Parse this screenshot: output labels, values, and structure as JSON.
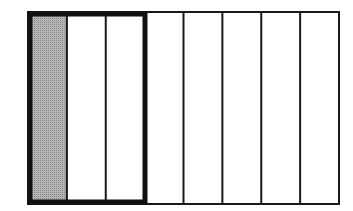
{
  "diagram": {
    "title": "",
    "total_parts": 8,
    "outlined_parts": 3,
    "shaded_parts": 1,
    "colors": {
      "shade": "#a9a9a9",
      "line": "#1a1a1a",
      "background": "#ffffff"
    },
    "fraction_shaded_of_outlined": "1/3",
    "fraction_outlined_of_whole": "3/8"
  }
}
